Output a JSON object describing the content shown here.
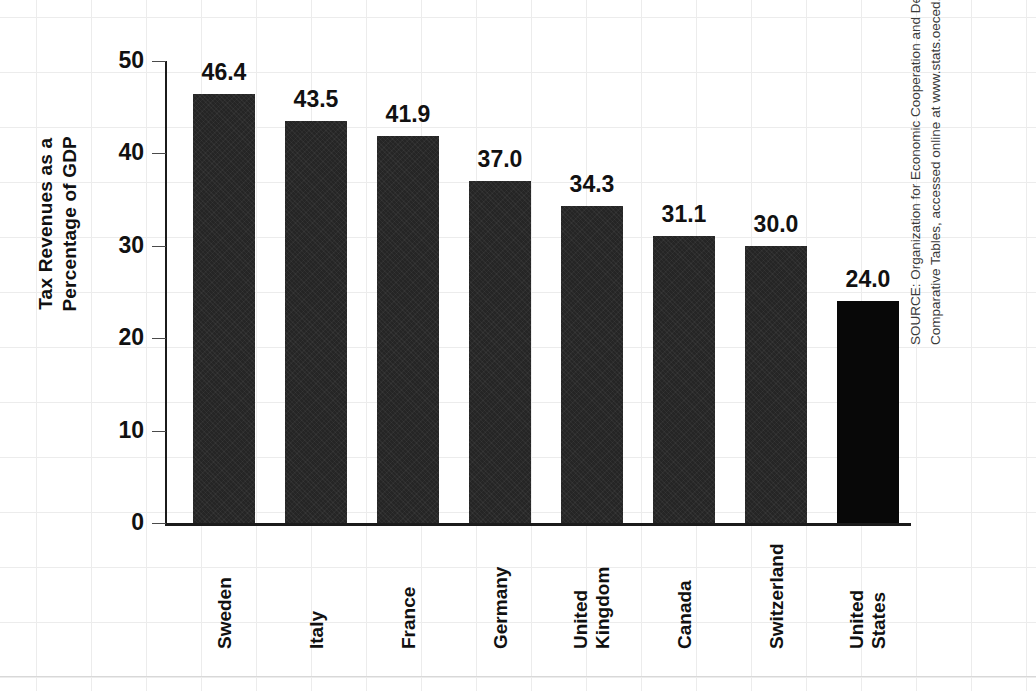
{
  "chart_data": {
    "type": "bar",
    "title": "",
    "xlabel": "",
    "ylabel": "Tax Revenues as a\nPercentage of GDP",
    "ylim": [
      0,
      50
    ],
    "yticks": [
      0,
      10,
      20,
      30,
      40,
      50
    ],
    "ytick_labels": [
      "0",
      "10",
      "20",
      "30",
      "40",
      "50"
    ],
    "grid": "background graph paper only",
    "legend": "none",
    "categories": [
      "Sweden",
      "Italy",
      "France",
      "Germany",
      "United\nKingdom",
      "Canada",
      "Switzerland",
      "United\nStates"
    ],
    "values": [
      46.4,
      43.5,
      41.9,
      37.0,
      34.3,
      31.1,
      30.0,
      24.0
    ],
    "value_labels": [
      "46.4",
      "43.5",
      "41.9",
      "37.0",
      "34.3",
      "31.1",
      "30.0",
      "24.0"
    ],
    "highlight_index": 7,
    "bar_color": "#252525",
    "highlight_color": "#080808"
  },
  "axes": {
    "y_title_line1": "Tax Revenues as a",
    "y_title_line2": "Percentage of GDP"
  },
  "source": {
    "text": "SOURCE: Organization for Economic Cooperation and Development, Tax Revenue Statistics:\nComparative Tables, accessed online at www.stats.oeced.org."
  }
}
